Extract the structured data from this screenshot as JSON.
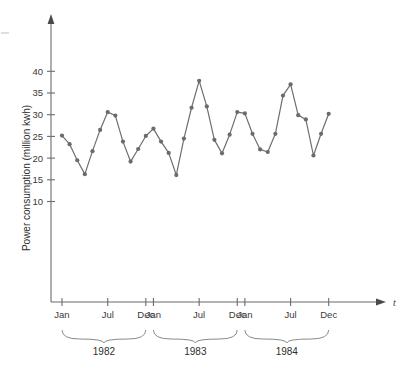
{
  "chart_data": {
    "type": "line",
    "title": "",
    "xlabel": "t",
    "ylabel": "Power consumption (million kwh)",
    "ylim": [
      0,
      44
    ],
    "yticks": [
      10,
      15,
      20,
      25,
      30,
      35,
      40
    ],
    "ytick_labels": [
      "10",
      "15",
      "20",
      "25",
      "30",
      "35",
      "40"
    ],
    "grid": false,
    "legend": null,
    "x_tick_labels": [
      "Jan",
      "Jul",
      "Dec",
      "Jan",
      "Jul",
      "Dec",
      "Jan",
      "Jul",
      "Dec"
    ],
    "group_labels": [
      "1982",
      "1983",
      "1984"
    ],
    "categories": [
      "Jan 1982",
      "Feb 1982",
      "Mar 1982",
      "Apr 1982",
      "May 1982",
      "Jun 1982",
      "Jul 1982",
      "Aug 1982",
      "Sep 1982",
      "Oct 1982",
      "Nov 1982",
      "Dec 1982",
      "Jan 1983",
      "Feb 1983",
      "Mar 1983",
      "Apr 1983",
      "May 1983",
      "Jun 1983",
      "Jul 1983",
      "Aug 1983",
      "Sep 1983",
      "Oct 1983",
      "Nov 1983",
      "Dec 1983",
      "Jan 1984",
      "Feb 1984",
      "Mar 1984",
      "Apr 1984",
      "May 1984",
      "Jun 1984",
      "Jul 1984",
      "Aug 1984",
      "Sep 1984",
      "Oct 1984",
      "Nov 1984",
      "Dec 1984"
    ],
    "values": [
      25.2,
      23.2,
      19.5,
      16.3,
      21.6,
      26.5,
      30.6,
      29.8,
      23.8,
      19.2,
      22.1,
      25.1,
      26.8,
      23.8,
      21.2,
      16.1,
      24.5,
      31.6,
      37.8,
      31.9,
      24.2,
      21.1,
      25.4,
      30.6,
      30.3,
      25.6,
      22.0,
      21.4,
      25.6,
      34.4,
      37.0,
      29.9,
      28.9,
      20.6,
      25.6,
      30.2
    ],
    "series_name": "Power consumption",
    "series_color": "#6b6b6b",
    "units": "million kwh"
  },
  "figure": {
    "y_axis_label": "Power consumption (million kwh)",
    "x_axis_label": "t",
    "months": [
      "Jan",
      "Jul",
      "Dec"
    ],
    "years": [
      "1982",
      "1983",
      "1984"
    ]
  }
}
